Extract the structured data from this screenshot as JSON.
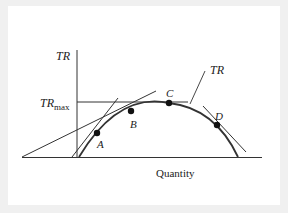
{
  "diagram": {
    "y_axis_label": "TR",
    "x_axis_label": "Quantity",
    "trmax_label_main": "TR",
    "trmax_label_sub": "max",
    "curve_label": "TR",
    "points": [
      {
        "label": "A"
      },
      {
        "label": "B"
      },
      {
        "label": "C"
      },
      {
        "label": "D"
      }
    ]
  },
  "colors": {
    "background": "#f0f0f0",
    "panel": "#ffffff",
    "ink": "#222222"
  }
}
